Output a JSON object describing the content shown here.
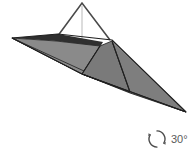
{
  "canvas": {
    "width": 194,
    "height": 155,
    "background": "#ffffff"
  },
  "figure": {
    "colors": {
      "face_light": "#8a8a8a",
      "face_mid": "#7e7e7e",
      "face_dark": "#6e6e6e",
      "edge_dark": "#2b2b2b",
      "edge_shadow": "#3a3a3a",
      "wireframe": "#4a4a4a",
      "pole": "#d9d9d9",
      "background": "#ffffff"
    },
    "vertices": {
      "apex": [
        82,
        3
      ],
      "left_tip": [
        12,
        38
      ],
      "left_inner": [
        58,
        36
      ],
      "ridge_mid": [
        112,
        40
      ],
      "right_tip": [
        186,
        112
      ],
      "fold_bottom": [
        82,
        74
      ],
      "base_left": [
        56,
        40
      ],
      "base_center": [
        100,
        45
      ]
    },
    "wireframe_triangle": {
      "apex": [
        82,
        3
      ],
      "left_base": [
        57,
        37
      ],
      "right_base": [
        110,
        40
      ]
    },
    "pole_line": {
      "from": [
        82,
        5
      ],
      "to": [
        82,
        42
      ]
    }
  },
  "rotation_indicator": {
    "icon": "rotation-arrow-icon",
    "label": "30°",
    "value": 30,
    "unit": "degrees",
    "color": "#5a5a5a"
  }
}
